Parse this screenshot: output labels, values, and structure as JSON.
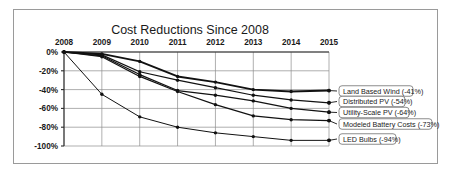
{
  "chart_data": {
    "type": "line",
    "title": "Cost Reductions Since 2008",
    "xlabel": "",
    "ylabel": "",
    "x": [
      2008,
      2009,
      2010,
      2011,
      2012,
      2013,
      2014,
      2015
    ],
    "categories": [
      "2008",
      "2009",
      "2010",
      "2011",
      "2012",
      "2013",
      "2014",
      "2015"
    ],
    "ylim": [
      -100,
      0
    ],
    "xlim": [
      2008,
      2015
    ],
    "yticks": [
      0,
      -20,
      -40,
      -60,
      -80,
      -100
    ],
    "ytick_labels": [
      "0%",
      "-20%",
      "-40%",
      "-60%",
      "-80%",
      "-100%"
    ],
    "grid": true,
    "legend_position": "right-inline-labels",
    "axis_position": "x-axis-on-top",
    "series": [
      {
        "name": "Land Based Wind",
        "label": "Land Based Wind (-41%)",
        "final_value": -41,
        "values": [
          0,
          -2,
          -10,
          -26,
          -32,
          -40,
          -42,
          -41
        ]
      },
      {
        "name": "Distributed PV",
        "label": "Distributed PV (-54%)",
        "final_value": -54,
        "values": [
          0,
          -3,
          -21,
          -30,
          -38,
          -46,
          -51,
          -54
        ]
      },
      {
        "name": "Utility-Scale PV",
        "label": "Utility-Scale PV (-64%)",
        "final_value": -64,
        "values": [
          0,
          -4,
          -24,
          -41,
          -46,
          -52,
          -60,
          -64
        ]
      },
      {
        "name": "Modeled Battery Costs",
        "label": "Modeled Battery Costs (-73%)",
        "final_value": -73,
        "values": [
          0,
          -5,
          -26,
          -42,
          -56,
          -68,
          -72,
          -73
        ]
      },
      {
        "name": "LED Bulbs",
        "label": "LED Bulbs (-94%)",
        "final_value": -94,
        "values": [
          0,
          -45,
          -69,
          -80,
          -86,
          -90,
          -94,
          -94
        ]
      }
    ]
  },
  "chart": {
    "title": "Cost Reductions Since 2008",
    "xtick_labels": [
      "2008",
      "2009",
      "2010",
      "2011",
      "2012",
      "2013",
      "2014",
      "2015"
    ],
    "ytick_labels": [
      "0%",
      "-20%",
      "-40%",
      "-60%",
      "-80%",
      "-100%"
    ],
    "legend_labels": [
      "Land Based Wind (-41%)",
      "Distributed PV (-54%)",
      "Utility-Scale PV (-64%)",
      "Modeled Battery Costs (-73%)",
      "LED Bulbs (-94%)"
    ]
  },
  "colors": {
    "line": "#111111",
    "grid": "#8c8c8c",
    "axis": "#2b2b2b",
    "frame": "#9a9a9a",
    "background": "#ffffff",
    "text": "#1a1a1a"
  }
}
